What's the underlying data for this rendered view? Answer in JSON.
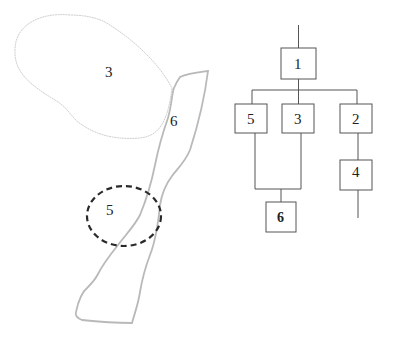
{
  "map": {
    "regions": [
      {
        "id": "region-3",
        "label": "3",
        "style": "thin-light-outline"
      },
      {
        "id": "region-6",
        "label": "6",
        "style": "gray-outline-strip"
      },
      {
        "id": "region-5",
        "label": "5",
        "style": "dashed-dark-ellipse"
      }
    ]
  },
  "tree": {
    "nodes": [
      {
        "id": "node-1",
        "label": "1"
      },
      {
        "id": "node-5",
        "label": "5"
      },
      {
        "id": "node-3",
        "label": "3"
      },
      {
        "id": "node-2",
        "label": "2"
      },
      {
        "id": "node-4",
        "label": "4"
      },
      {
        "id": "node-6",
        "label": "6"
      }
    ],
    "edges": [
      [
        "1",
        "5"
      ],
      [
        "1",
        "3"
      ],
      [
        "1",
        "2"
      ],
      [
        "5",
        "6"
      ],
      [
        "3",
        "6"
      ],
      [
        "2",
        "4"
      ]
    ]
  },
  "colors": {
    "region3_stroke": "#cfcfcf",
    "region6_stroke": "#b9b9b9",
    "region5_stroke": "#2a2a2a",
    "tree_stroke": "#555555"
  }
}
